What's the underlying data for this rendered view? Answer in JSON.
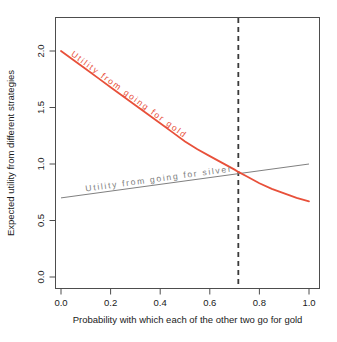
{
  "chart_data": {
    "type": "line",
    "title": "",
    "subtitle": "",
    "xlabel": "Probability with which each of the other two go for gold",
    "ylabel": "Expected utility from different strategies",
    "xlim": [
      -0.04,
      1.04
    ],
    "ylim": [
      -0.08,
      2.18
    ],
    "xticks": [
      0.0,
      0.2,
      0.4,
      0.6,
      0.8,
      1.0
    ],
    "xtick_labels": [
      "0.0",
      "0.2",
      "0.4",
      "0.6",
      "0.8",
      "1.0"
    ],
    "yticks": [
      0.0,
      0.5,
      1.0,
      1.5,
      2.0
    ],
    "ytick_labels": [
      "0.0",
      "0.5",
      "1.0",
      "1.5",
      "2.0"
    ],
    "grid": false,
    "legend": "inline-curve-labels",
    "series": [
      {
        "name": "Utility from going for gold",
        "label": "Utility from going for gold",
        "color": "#E8503A",
        "style": "solid",
        "width": 1.8,
        "shape": "convex-decreasing",
        "x": [
          0.0,
          0.05,
          0.1,
          0.15,
          0.2,
          0.25,
          0.3,
          0.35,
          0.4,
          0.45,
          0.5,
          0.55,
          0.6,
          0.65,
          0.7,
          0.715,
          0.75,
          0.8,
          0.85,
          0.9,
          0.95,
          1.0
        ],
        "y": [
          2.0,
          1.92,
          1.84,
          1.76,
          1.68,
          1.6,
          1.52,
          1.44,
          1.36,
          1.28,
          1.2,
          1.13,
          1.07,
          1.01,
          0.95,
          0.93,
          0.89,
          0.83,
          0.78,
          0.74,
          0.7,
          0.67
        ]
      },
      {
        "name": "Utility from going for silver",
        "label": "Utility from going for silver",
        "color": "#808080",
        "style": "solid",
        "width": 1.0,
        "shape": "linear-increasing",
        "x": [
          0.0,
          1.0
        ],
        "y": [
          0.7,
          1.0
        ]
      }
    ],
    "annotations": [
      {
        "type": "vline",
        "name": "crossing-point-vline",
        "x": 0.715,
        "style": "dashed",
        "color": "#3a3a3a",
        "width": 1.8
      },
      {
        "type": "crossing",
        "name": "equilibrium-crossing",
        "x": 0.715,
        "y": 0.93
      }
    ]
  },
  "axes": {
    "x_title": "Probability with which each of the other two go for gold",
    "y_title": "Expected utility from different strategies"
  },
  "labels": {
    "gold_curve": "Utility from going for gold",
    "silver_line": "Utility from going for silver"
  },
  "colors": {
    "gold_curve": "#E8503A",
    "silver_line": "#808080",
    "vline": "#3a3a3a",
    "frame": "#4d4d4d",
    "background": "#ffffff",
    "text": "#1a1a1a"
  }
}
